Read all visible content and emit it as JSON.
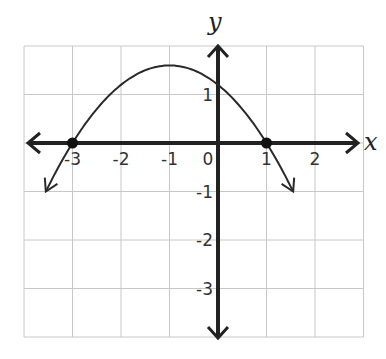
{
  "chart_data": {
    "type": "line",
    "title": "",
    "xlabel": "x",
    "ylabel": "y",
    "xlim": [
      -4,
      3
    ],
    "ylim": [
      -4,
      2
    ],
    "grid": true,
    "x_ticks": [
      "-3",
      "-2",
      "-1",
      "0",
      "1",
      "2"
    ],
    "y_ticks": [
      "1",
      "-1",
      "-2",
      "-3"
    ],
    "series": [
      {
        "name": "parabola",
        "equation": "y = -0.4(x+3)(x-1)",
        "vertex": [
          -1,
          1.6
        ],
        "y_intercept": 1.2,
        "x_intercepts": [
          -3,
          1
        ],
        "points": [
          [
            -3.7,
            -1.3
          ],
          [
            -3,
            0
          ],
          [
            -2,
            1.2
          ],
          [
            -1,
            1.6
          ],
          [
            0,
            1.2
          ],
          [
            1,
            0
          ],
          [
            1.7,
            -1.3
          ]
        ]
      }
    ],
    "marked_points": [
      [
        -3,
        0
      ],
      [
        1,
        0
      ]
    ]
  }
}
